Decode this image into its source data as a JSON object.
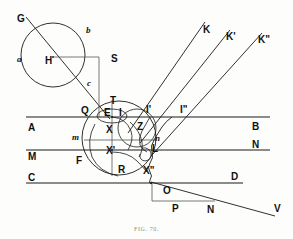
{
  "figure": {
    "caption": "FIG. 70.",
    "stroke_color": "#1a1a1a",
    "background_color": "#fdfdfb",
    "width": 293,
    "height": 239
  },
  "labels": {
    "G": "G",
    "a": "a",
    "b": "b",
    "c": "c",
    "H": "H",
    "S": "S",
    "T": "T",
    "Q": "Q",
    "E": "E",
    "I": "I",
    "I_prime": "I'",
    "I_double_prime": "I\"",
    "K": "K",
    "K_prime": "K'",
    "K_double_prime": "K\"",
    "A": "A",
    "B": "B",
    "M": "M",
    "N_right": "N",
    "C": "C",
    "D": "D",
    "X": "X",
    "X_prime": "X'",
    "X_double_prime": "X\"",
    "Z": "Z",
    "m": "m",
    "n": "n",
    "F": "F",
    "R": "R",
    "L": "L",
    "O": "O",
    "P": "P",
    "N_bottom": "N",
    "V": "V"
  },
  "geometry": {
    "circle_upper": {
      "cx": 53,
      "cy": 55,
      "r": 32
    },
    "circle_main": {
      "cx": 119,
      "cy": 138,
      "r": 37
    },
    "circle_inner": {
      "cx": 137,
      "cy": 128,
      "r": 19
    },
    "line_AB_y": 117,
    "line_MN_y": 150,
    "line_CD_y": 183
  }
}
